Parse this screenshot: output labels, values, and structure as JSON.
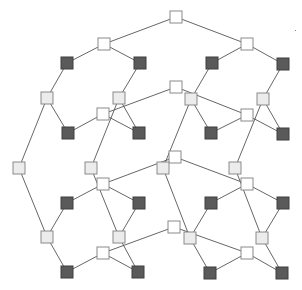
{
  "diagram": {
    "type": "graph",
    "width": 302,
    "height": 290,
    "node_size": 12,
    "colors": {
      "background": "#ffffff",
      "edge": "#555555",
      "white_fill": "#ffffff",
      "light_fill": "#ececec",
      "dark_fill": "#5a5a5a",
      "border": "#8a8a8a"
    },
    "nodes": [
      {
        "id": "n0",
        "x": 176,
        "y": 17,
        "kind": "white"
      },
      {
        "id": "n1",
        "x": 104,
        "y": 44,
        "kind": "white"
      },
      {
        "id": "n2",
        "x": 247,
        "y": 44,
        "kind": "white"
      },
      {
        "id": "n3",
        "x": 67,
        "y": 63,
        "kind": "dark"
      },
      {
        "id": "n4",
        "x": 140,
        "y": 63,
        "kind": "dark"
      },
      {
        "id": "n5",
        "x": 212,
        "y": 63,
        "kind": "dark"
      },
      {
        "id": "n6",
        "x": 283,
        "y": 64,
        "kind": "dark"
      },
      {
        "id": "n7",
        "x": 176,
        "y": 87,
        "kind": "white"
      },
      {
        "id": "n8",
        "x": 47,
        "y": 98,
        "kind": "light"
      },
      {
        "id": "n9",
        "x": 119,
        "y": 98,
        "kind": "light"
      },
      {
        "id": "n10",
        "x": 191,
        "y": 99,
        "kind": "light"
      },
      {
        "id": "n11",
        "x": 263,
        "y": 99,
        "kind": "light"
      },
      {
        "id": "n12",
        "x": 103,
        "y": 114,
        "kind": "white"
      },
      {
        "id": "n13",
        "x": 247,
        "y": 115,
        "kind": "white"
      },
      {
        "id": "n14",
        "x": 68,
        "y": 133,
        "kind": "dark"
      },
      {
        "id": "n15",
        "x": 139,
        "y": 133,
        "kind": "dark"
      },
      {
        "id": "n16",
        "x": 211,
        "y": 133,
        "kind": "dark"
      },
      {
        "id": "n17",
        "x": 283,
        "y": 134,
        "kind": "dark"
      },
      {
        "id": "n18",
        "x": 175,
        "y": 157,
        "kind": "white"
      },
      {
        "id": "n19",
        "x": 19,
        "y": 168,
        "kind": "light"
      },
      {
        "id": "n20",
        "x": 91,
        "y": 168,
        "kind": "light"
      },
      {
        "id": "n21",
        "x": 163,
        "y": 168,
        "kind": "light"
      },
      {
        "id": "n22",
        "x": 235,
        "y": 168,
        "kind": "light"
      },
      {
        "id": "n23",
        "x": 103,
        "y": 184,
        "kind": "white"
      },
      {
        "id": "n24",
        "x": 247,
        "y": 184,
        "kind": "white"
      },
      {
        "id": "n25",
        "x": 67,
        "y": 203,
        "kind": "dark"
      },
      {
        "id": "n26",
        "x": 139,
        "y": 203,
        "kind": "dark"
      },
      {
        "id": "n27",
        "x": 211,
        "y": 203,
        "kind": "dark"
      },
      {
        "id": "n28",
        "x": 283,
        "y": 203,
        "kind": "dark"
      },
      {
        "id": "n29",
        "x": 174,
        "y": 227,
        "kind": "white"
      },
      {
        "id": "n30",
        "x": 47,
        "y": 237,
        "kind": "light"
      },
      {
        "id": "n31",
        "x": 119,
        "y": 237,
        "kind": "light"
      },
      {
        "id": "n32",
        "x": 190,
        "y": 238,
        "kind": "light"
      },
      {
        "id": "n33",
        "x": 262,
        "y": 238,
        "kind": "light"
      },
      {
        "id": "n34",
        "x": 103,
        "y": 253,
        "kind": "white"
      },
      {
        "id": "n35",
        "x": 247,
        "y": 253,
        "kind": "white"
      },
      {
        "id": "n36",
        "x": 67,
        "y": 272,
        "kind": "dark"
      },
      {
        "id": "n37",
        "x": 138,
        "y": 272,
        "kind": "dark"
      },
      {
        "id": "n38",
        "x": 210,
        "y": 273,
        "kind": "dark"
      },
      {
        "id": "n39",
        "x": 282,
        "y": 273,
        "kind": "dark"
      }
    ],
    "edges": [
      [
        "n0",
        "n1"
      ],
      [
        "n0",
        "n2"
      ],
      [
        "n1",
        "n3"
      ],
      [
        "n1",
        "n4"
      ],
      [
        "n2",
        "n5"
      ],
      [
        "n2",
        "n6"
      ],
      [
        "n3",
        "n8"
      ],
      [
        "n4",
        "n9"
      ],
      [
        "n5",
        "n10"
      ],
      [
        "n6",
        "n11"
      ],
      [
        "n7",
        "n12"
      ],
      [
        "n7",
        "n13"
      ],
      [
        "n12",
        "n14"
      ],
      [
        "n12",
        "n15"
      ],
      [
        "n13",
        "n16"
      ],
      [
        "n13",
        "n17"
      ],
      [
        "n8",
        "n14"
      ],
      [
        "n9",
        "n15"
      ],
      [
        "n10",
        "n16"
      ],
      [
        "n11",
        "n17"
      ],
      [
        "n8",
        "n19"
      ],
      [
        "n9",
        "n20"
      ],
      [
        "n10",
        "n21"
      ],
      [
        "n11",
        "n22"
      ],
      [
        "n18",
        "n23"
      ],
      [
        "n18",
        "n24"
      ],
      [
        "n23",
        "n25"
      ],
      [
        "n23",
        "n26"
      ],
      [
        "n24",
        "n27"
      ],
      [
        "n24",
        "n28"
      ],
      [
        "n19",
        "n30"
      ],
      [
        "n20",
        "n31"
      ],
      [
        "n21",
        "n32"
      ],
      [
        "n22",
        "n33"
      ],
      [
        "n25",
        "n30"
      ],
      [
        "n26",
        "n31"
      ],
      [
        "n27",
        "n32"
      ],
      [
        "n28",
        "n33"
      ],
      [
        "n29",
        "n34"
      ],
      [
        "n29",
        "n35"
      ],
      [
        "n34",
        "n36"
      ],
      [
        "n34",
        "n37"
      ],
      [
        "n35",
        "n38"
      ],
      [
        "n35",
        "n39"
      ],
      [
        "n30",
        "n36"
      ],
      [
        "n31",
        "n37"
      ],
      [
        "n32",
        "n38"
      ],
      [
        "n33",
        "n39"
      ]
    ],
    "marks": [
      {
        "id": "dot",
        "x": 295,
        "y": 30
      }
    ]
  }
}
